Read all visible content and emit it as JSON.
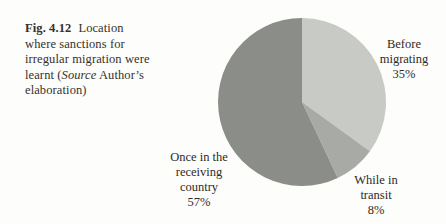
{
  "caption": {
    "fig_label": "Fig. 4.12",
    "line1_rest": "Location",
    "line2": "where sanctions for",
    "line3": "irregular migration were",
    "line4_before": "learnt (",
    "source_word": "Source",
    "line4_after": " Author’s",
    "line5": "elaboration)"
  },
  "chart_data": {
    "type": "pie",
    "title": "Location where sanctions for irregular migration were learnt",
    "source": "Author’s elaboration",
    "start_angle": "12-oclock",
    "direction": "clockwise",
    "legend": "none",
    "slices": [
      {
        "id": "before-migrating",
        "label": "Before migrating",
        "value": 35,
        "color": "#c8cac6"
      },
      {
        "id": "while-in-transit",
        "label": "While in transit",
        "value": 8,
        "color": "#a8aaa6"
      },
      {
        "id": "once-in-the-receiving-country",
        "label": "Once in the receiving country",
        "value": 57,
        "color": "#8b8d89"
      }
    ],
    "labels": {
      "before_migrating": [
        "Before",
        "migrating",
        "35%"
      ],
      "while_in_transit": [
        "While in",
        "transit",
        "8%"
      ],
      "once_in_receiving_country": [
        "Once in the",
        "receiving",
        "country",
        "57%"
      ]
    }
  }
}
